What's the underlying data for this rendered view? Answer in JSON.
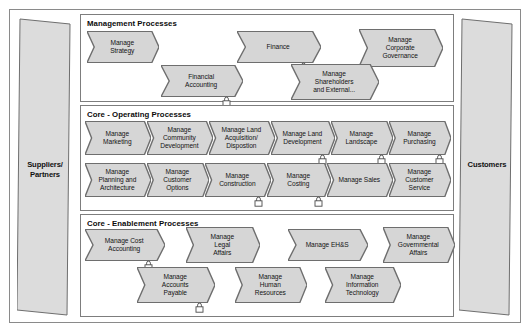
{
  "diagram": {
    "colors": {
      "chevron_fill": "#d6d6d6",
      "chevron_stroke": "#6e6e6e",
      "actor_fill": "#dcdcdc",
      "actor_stroke": "#6e6e6e",
      "panel_stroke": "#7d7d7d",
      "frame_stroke": "#8a8a8a",
      "text": "#141414",
      "background": "#ffffff"
    },
    "actors": {
      "left": {
        "label": "Suppliers/\nPartners",
        "name": "suppliers-partners"
      },
      "right": {
        "label": "Customers",
        "name": "customers"
      }
    },
    "groups": [
      {
        "id": "management",
        "title": "Management Processes",
        "rows": [
          {
            "processes": [
              {
                "label": "Manage\nStrategy",
                "x": 6,
                "y": 16,
                "w": 72,
                "h": 32,
                "lock": false
              },
              {
                "label": "Finance",
                "x": 156,
                "y": 16,
                "w": 84,
                "h": 32,
                "lock": true
              },
              {
                "label": "Manage\nCorporate\nGovernance",
                "x": 278,
                "y": 14,
                "w": 84,
                "h": 38,
                "lock": false
              }
            ]
          },
          {
            "processes": [
              {
                "label": "Financial\nAccounting",
                "x": 80,
                "y": 50,
                "w": 82,
                "h": 32,
                "lock": true
              },
              {
                "label": "Manage\nShareholders\nand External...",
                "x": 210,
                "y": 49,
                "w": 88,
                "h": 36,
                "lock": false
              }
            ]
          }
        ]
      },
      {
        "id": "operating",
        "title": "Core - Operating Processes",
        "rows": [
          {
            "processes": [
              {
                "label": "Manage\nMarketing",
                "x": 4,
                "y": 15,
                "w": 66,
                "h": 34,
                "lock": false
              },
              {
                "label": "Manage\nCommunity\nDevelopment",
                "x": 66,
                "y": 15,
                "w": 66,
                "h": 34,
                "lock": false
              },
              {
                "label": "Manage Land\nAcquisition/\nDispostion",
                "x": 128,
                "y": 15,
                "w": 66,
                "h": 34,
                "lock": false
              },
              {
                "label": "Manage Land\nDevelopment",
                "x": 190,
                "y": 15,
                "w": 64,
                "h": 34,
                "lock": true
              },
              {
                "label": "Manage\nLandscape",
                "x": 250,
                "y": 15,
                "w": 62,
                "h": 34,
                "lock": true
              },
              {
                "label": "Manage\nPurchasing",
                "x": 308,
                "y": 15,
                "w": 62,
                "h": 34,
                "lock": true
              }
            ]
          },
          {
            "processes": [
              {
                "label": "Manage\nPlanning and\nArchitecture",
                "x": 4,
                "y": 57,
                "w": 66,
                "h": 34,
                "lock": false
              },
              {
                "label": "Manage\nCustomer\nOptions",
                "x": 66,
                "y": 57,
                "w": 62,
                "h": 34,
                "lock": false
              },
              {
                "label": "Manage\nConstruction",
                "x": 124,
                "y": 57,
                "w": 66,
                "h": 34,
                "lock": true
              },
              {
                "label": "Manage\nCosting",
                "x": 186,
                "y": 57,
                "w": 64,
                "h": 34,
                "lock": true
              },
              {
                "label": "Manage Sales",
                "x": 246,
                "y": 57,
                "w": 66,
                "h": 34,
                "lock": false
              },
              {
                "label": "Manage\nCustomer\nService",
                "x": 308,
                "y": 57,
                "w": 62,
                "h": 34,
                "lock": false
              }
            ]
          }
        ]
      },
      {
        "id": "enablement",
        "title": "Core - Enablement Processes",
        "rows": [
          {
            "processes": [
              {
                "label": "Manage Cost\nAccounting",
                "x": 4,
                "y": 14,
                "w": 80,
                "h": 32,
                "lock": true
              },
              {
                "label": "Manage\nLegal\nAffairs",
                "x": 105,
                "y": 12,
                "w": 74,
                "h": 36,
                "lock": false
              },
              {
                "label": "Manage EH&S",
                "x": 207,
                "y": 14,
                "w": 80,
                "h": 32,
                "lock": false
              },
              {
                "label": "Manage\nGovernmental\nAffairs",
                "x": 302,
                "y": 12,
                "w": 72,
                "h": 36,
                "lock": false
              }
            ]
          },
          {
            "processes": [
              {
                "label": "Manage\nAccounts\nPayable",
                "x": 56,
                "y": 52,
                "w": 78,
                "h": 36,
                "lock": true
              },
              {
                "label": "Manage\nHuman\nResources",
                "x": 154,
                "y": 52,
                "w": 72,
                "h": 36,
                "lock": false
              },
              {
                "label": "Manage\nInformation\nTechnology",
                "x": 244,
                "y": 52,
                "w": 76,
                "h": 36,
                "lock": false
              }
            ]
          }
        ]
      }
    ]
  }
}
